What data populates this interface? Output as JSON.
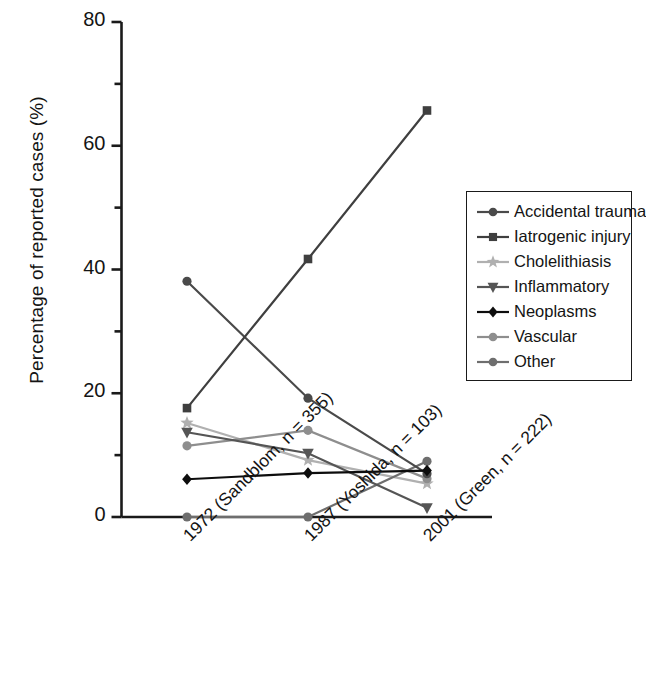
{
  "chart_data": {
    "type": "line",
    "title": "",
    "xlabel": "",
    "ylabel": "Percentage of reported cases (%)",
    "categories": [
      "1972 (Sandblom, n = 355)",
      "1987 (Yoshida, n = 103)",
      "2001 (Green, n = 222)"
    ],
    "ylim": [
      0,
      80
    ],
    "yticks": [
      0,
      20,
      40,
      60,
      80
    ],
    "ytick_labels": [
      "0",
      "20",
      "40",
      "60",
      "80"
    ],
    "yminor_ticks": [
      10,
      30,
      50,
      70
    ],
    "grid": false,
    "legend_position": "right",
    "series": [
      {
        "name": "Accidental trauma",
        "marker": "circle",
        "color": "#4a4a4a",
        "values": [
          38.1,
          19.2,
          7.0
        ]
      },
      {
        "name": "Iatrogenic injury",
        "marker": "square",
        "color": "#3f3f3f",
        "values": [
          17.6,
          41.7,
          65.7
        ]
      },
      {
        "name": "Cholelithiasis",
        "marker": "star",
        "color": "#b0b0b0",
        "values": [
          15.2,
          9.2,
          5.4
        ]
      },
      {
        "name": "Inflammatory",
        "marker": "triangle-down",
        "color": "#555555",
        "values": [
          13.7,
          10.3,
          1.5
        ]
      },
      {
        "name": "Neoplasms",
        "marker": "diamond",
        "color": "#0d0d0d",
        "values": [
          6.1,
          7.1,
          7.5
        ]
      },
      {
        "name": "Vascular",
        "marker": "circle",
        "color": "#8e8e8e",
        "values": [
          11.5,
          14.0,
          6.2
        ]
      },
      {
        "name": "Other",
        "marker": "circle",
        "color": "#6e6e6e",
        "values": [
          0.0,
          0.0,
          9.0
        ]
      }
    ]
  },
  "axis": {
    "y_title": "Percentage of reported cases (%)",
    "tick_labels": [
      "80",
      "60",
      "40",
      "20",
      "0"
    ]
  },
  "legend": {
    "items": [
      {
        "label": "Accidental trauma"
      },
      {
        "label": "Iatrogenic injury"
      },
      {
        "label": "Cholelithiasis"
      },
      {
        "label": "Inflammatory"
      },
      {
        "label": "Neoplasms"
      },
      {
        "label": "Vascular"
      },
      {
        "label": "Other"
      }
    ]
  }
}
